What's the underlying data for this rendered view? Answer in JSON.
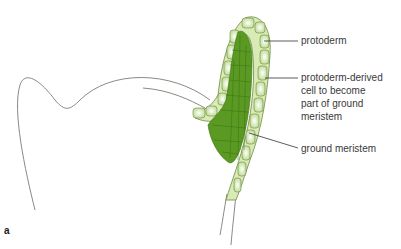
{
  "figure": {
    "panel_label": "a",
    "labels": [
      {
        "id": "protoderm",
        "text": "protoderm"
      },
      {
        "id": "derived-line1",
        "text": "protoderm-derived"
      },
      {
        "id": "derived-line2",
        "text": "cell to become"
      },
      {
        "id": "derived-line3",
        "text": "part of ground"
      },
      {
        "id": "derived-line4",
        "text": "meristem"
      },
      {
        "id": "ground-meristem",
        "text": "ground meristem"
      }
    ],
    "colors": {
      "ground_meristem": "#5a9a22",
      "protoderm": "#e4f0c6",
      "outline": "#7a7a6a",
      "cell_wall": "#3d6e14",
      "leader_line": "#333333"
    }
  }
}
